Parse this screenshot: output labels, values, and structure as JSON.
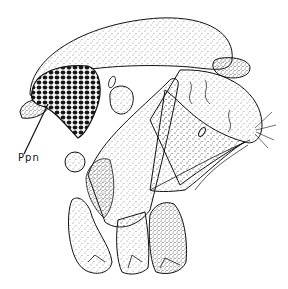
{
  "figure": {
    "labels": [
      {
        "id": "ppn",
        "text": "Ppn",
        "x": 18,
        "y": 160,
        "arrow_to": [
          48,
          104
        ]
      }
    ],
    "colors": {
      "ink": "#111111",
      "background": "#ffffff",
      "eye": "#1a1a1a"
    }
  }
}
